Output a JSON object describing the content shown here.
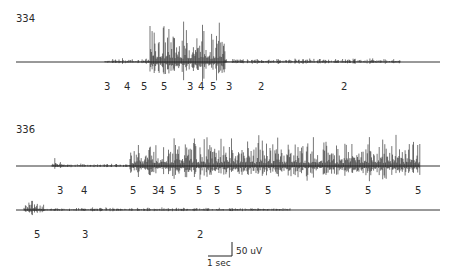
{
  "chart_data": {
    "type": "line",
    "title": "",
    "xlabel": "",
    "ylabel": "",
    "grid": false,
    "traces": [
      {
        "id": "334",
        "label": "334",
        "baseline_y": 62,
        "x_start": 16,
        "x_end": 440,
        "stage_labels": [
          {
            "text": "3",
            "x": 107
          },
          {
            "text": "4",
            "x": 127
          },
          {
            "text": "5",
            "x": 144
          },
          {
            "text": "5",
            "x": 164
          },
          {
            "text": "3",
            "x": 190
          },
          {
            "text": "4",
            "x": 201
          },
          {
            "text": "5",
            "x": 213
          },
          {
            "text": "3",
            "x": 229
          },
          {
            "text": "2",
            "x": 261
          },
          {
            "text": "2",
            "x": 344
          }
        ],
        "activity_segments": [
          {
            "x0": 105,
            "x1": 150,
            "amplitude": 3
          },
          {
            "x0": 150,
            "x1": 225,
            "amplitude": 32
          },
          {
            "x0": 225,
            "x1": 400,
            "amplitude": 3
          }
        ]
      },
      {
        "id": "336",
        "label": "336",
        "baseline_y": 166,
        "x_start": 16,
        "x_end": 440,
        "stage_labels": [
          {
            "text": "3",
            "x": 60
          },
          {
            "text": "4",
            "x": 84
          },
          {
            "text": "5",
            "x": 133
          },
          {
            "text": "34",
            "x": 155
          },
          {
            "text": "5",
            "x": 173
          },
          {
            "text": "5",
            "x": 199
          },
          {
            "text": "5",
            "x": 217
          },
          {
            "text": "5",
            "x": 239
          },
          {
            "text": "5",
            "x": 268
          },
          {
            "text": "5",
            "x": 328
          },
          {
            "text": "5",
            "x": 368
          },
          {
            "text": "5",
            "x": 418
          }
        ],
        "activity_segments": [
          {
            "x0": 52,
            "x1": 64,
            "amplitude": 6
          },
          {
            "x0": 64,
            "x1": 130,
            "amplitude": 2
          },
          {
            "x0": 130,
            "x1": 420,
            "amplitude": 24
          }
        ]
      },
      {
        "id": "336-cont",
        "label": "",
        "baseline_y": 210,
        "x_start": 16,
        "x_end": 440,
        "stage_labels": [
          {
            "text": "5",
            "x": 37
          },
          {
            "text": "3",
            "x": 85
          },
          {
            "text": "2",
            "x": 200
          }
        ],
        "activity_segments": [
          {
            "x0": 24,
            "x1": 45,
            "amplitude": 8
          },
          {
            "x0": 45,
            "x1": 290,
            "amplitude": 2
          }
        ]
      }
    ],
    "scale_bar": {
      "time_label": "1 sec",
      "amplitude_label": "50 uV"
    },
    "legend": []
  }
}
